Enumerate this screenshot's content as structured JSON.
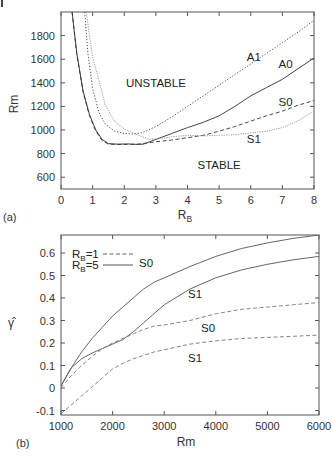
{
  "chart_data": [
    {
      "panel": "(a)",
      "type": "line",
      "title": "",
      "xlabel": "R_B",
      "ylabel": "Rm",
      "xlim": [
        0,
        8
      ],
      "ylim": [
        500,
        2000
      ],
      "xticks": [
        0,
        1,
        2,
        3,
        4,
        5,
        6,
        7,
        8
      ],
      "yticks": [
        600,
        800,
        1000,
        1200,
        1400,
        1600,
        1800
      ],
      "grid": false,
      "annotations": [
        {
          "text": "UNSTABLE",
          "x": 3.0,
          "y": 1400
        },
        {
          "text": "STABLE",
          "x": 5.0,
          "y": 700
        },
        {
          "text": "A1",
          "x": 6.1,
          "y": 1620
        },
        {
          "text": "A0",
          "x": 7.1,
          "y": 1560
        },
        {
          "text": "S0",
          "x": 7.1,
          "y": 1240
        },
        {
          "text": "S1",
          "x": 6.1,
          "y": 920
        }
      ],
      "series": [
        {
          "name": "A0",
          "style": "solid",
          "color": "#444444",
          "x": [
            0.35,
            0.5,
            0.7,
            0.9,
            1.1,
            1.3,
            1.5,
            1.8,
            2.1,
            2.4,
            2.6,
            3.0,
            3.5,
            4.0,
            4.5,
            5.0,
            5.5,
            6.0,
            6.5,
            7.0,
            7.5,
            8.0
          ],
          "y": [
            2000,
            1650,
            1330,
            1130,
            1000,
            920,
            885,
            880,
            882,
            878,
            880,
            920,
            970,
            1020,
            1065,
            1120,
            1200,
            1290,
            1360,
            1430,
            1520,
            1610
          ]
        },
        {
          "name": "A1",
          "style": "dotted",
          "color": "#555555",
          "x": [
            0.75,
            0.85,
            1.0,
            1.2,
            1.4,
            1.7,
            2.0,
            2.3,
            2.6,
            3.0,
            3.5,
            4.0,
            4.5,
            5.0,
            5.5,
            6.0,
            6.5,
            7.0,
            7.5,
            8.0
          ],
          "y": [
            2000,
            1650,
            1350,
            1150,
            1050,
            990,
            970,
            965,
            980,
            1030,
            1110,
            1200,
            1290,
            1380,
            1470,
            1560,
            1650,
            1740,
            1830,
            1930
          ]
        },
        {
          "name": "S0",
          "style": "dashed",
          "color": "#333333",
          "x": [
            0.35,
            0.5,
            0.7,
            0.9,
            1.1,
            1.3,
            1.5,
            1.8,
            2.1,
            2.4,
            2.7,
            3.0,
            3.5,
            4.0,
            4.5,
            5.0,
            5.5,
            6.0,
            6.5,
            7.0,
            7.5,
            8.0
          ],
          "y": [
            2000,
            1640,
            1320,
            1120,
            990,
            910,
            880,
            878,
            878,
            880,
            888,
            900,
            915,
            935,
            955,
            990,
            1030,
            1075,
            1120,
            1160,
            1210,
            1250
          ]
        },
        {
          "name": "S1",
          "style": "dotted-light",
          "color": "#999999",
          "x": [
            0.8,
            0.9,
            1.0,
            1.2,
            1.4,
            1.7,
            2.0,
            2.4,
            2.8,
            3.2,
            3.6,
            4.0,
            4.5,
            5.0,
            5.5,
            6.0,
            6.5,
            7.0,
            7.5,
            8.0
          ],
          "y": [
            2000,
            1800,
            1620,
            1420,
            1210,
            1070,
            1010,
            960,
            920,
            930,
            945,
            955,
            950,
            955,
            960,
            975,
            990,
            1020,
            1080,
            1160
          ]
        }
      ]
    },
    {
      "panel": "(b)",
      "type": "line",
      "title": "",
      "xlabel": "Rm",
      "ylabel": "γ̂",
      "xlim": [
        1000,
        6000
      ],
      "ylim": [
        -0.12,
        0.68
      ],
      "xticks": [
        1000,
        2000,
        3000,
        4000,
        5000,
        6000
      ],
      "yticks": [
        -0.1,
        0,
        0.1,
        0.2,
        0.3,
        0.4,
        0.5,
        0.6
      ],
      "grid": false,
      "legend": {
        "position": "upper-left",
        "entries": [
          {
            "label_main": "R",
            "label_sub": "B",
            "label_rest": "=1",
            "style": "dashed"
          },
          {
            "label_main": "R",
            "label_sub": "B",
            "label_rest": "=5",
            "style": "solid"
          }
        ]
      },
      "annotations": [
        {
          "text": "S0",
          "x": 2650,
          "y": 0.555
        },
        {
          "text": "S1",
          "x": 3600,
          "y": 0.42
        },
        {
          "text": "S0",
          "x": 3850,
          "y": 0.265
        },
        {
          "text": "S1",
          "x": 3600,
          "y": 0.135
        }
      ],
      "series": [
        {
          "name": "S0 (R_B=5)",
          "style": "solid",
          "color": "#666666",
          "x": [
            1000,
            1200,
            1400,
            1600,
            1800,
            2000,
            2200,
            2400,
            2600,
            2800,
            3000,
            3500,
            4000,
            4500,
            5000,
            5500,
            6000
          ],
          "y": [
            0.01,
            0.09,
            0.16,
            0.22,
            0.27,
            0.32,
            0.36,
            0.4,
            0.44,
            0.47,
            0.49,
            0.54,
            0.585,
            0.62,
            0.645,
            0.665,
            0.68
          ]
        },
        {
          "name": "S1 (R_B=5)",
          "style": "solid",
          "color": "#666666",
          "x": [
            1000,
            1200,
            1400,
            1600,
            1800,
            2000,
            2200,
            2400,
            2600,
            2800,
            3000,
            3500,
            4000,
            4500,
            5000,
            5500,
            6000
          ],
          "y": [
            0.01,
            0.09,
            0.13,
            0.155,
            0.175,
            0.195,
            0.215,
            0.25,
            0.29,
            0.33,
            0.37,
            0.44,
            0.49,
            0.525,
            0.55,
            0.57,
            0.585
          ]
        },
        {
          "name": "S0 (R_B=1)",
          "style": "dashed",
          "color": "#777777",
          "x": [
            1000,
            1200,
            1400,
            1600,
            1800,
            2000,
            2200,
            2400,
            2600,
            2800,
            3000,
            3500,
            4000,
            4500,
            5000,
            5500,
            6000
          ],
          "y": [
            0.0,
            0.055,
            0.1,
            0.14,
            0.175,
            0.2,
            0.22,
            0.24,
            0.26,
            0.275,
            0.28,
            0.3,
            0.33,
            0.35,
            0.36,
            0.37,
            0.38
          ]
        },
        {
          "name": "S1 (R_B=1)",
          "style": "dashed",
          "color": "#777777",
          "x": [
            1000,
            1200,
            1400,
            1600,
            1800,
            2000,
            2200,
            2400,
            2600,
            2800,
            3000,
            3500,
            4000,
            4500,
            5000,
            5500,
            6000
          ],
          "y": [
            -0.115,
            -0.075,
            -0.035,
            0.005,
            0.045,
            0.085,
            0.11,
            0.13,
            0.145,
            0.16,
            0.17,
            0.195,
            0.21,
            0.22,
            0.225,
            0.23,
            0.235
          ]
        }
      ]
    }
  ]
}
